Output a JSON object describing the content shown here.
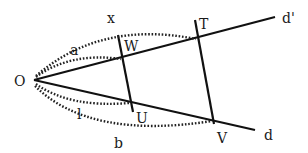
{
  "diagram": {
    "type": "geometry-figure",
    "points": {
      "O": {
        "label": "O"
      },
      "W": {
        "label": "W"
      },
      "T": {
        "label": "T"
      },
      "U": {
        "label": "U"
      },
      "V": {
        "label": "V"
      }
    },
    "lines": {
      "d_prime": {
        "label": "d'"
      },
      "d": {
        "label": "d"
      }
    },
    "arcs": {
      "OT": {
        "label": "x"
      },
      "OW": {
        "label": "a"
      },
      "OU": {
        "label": "l"
      },
      "OV": {
        "label": "b"
      }
    }
  },
  "colors": {
    "stroke": "#111111",
    "background": "#ffffff"
  }
}
